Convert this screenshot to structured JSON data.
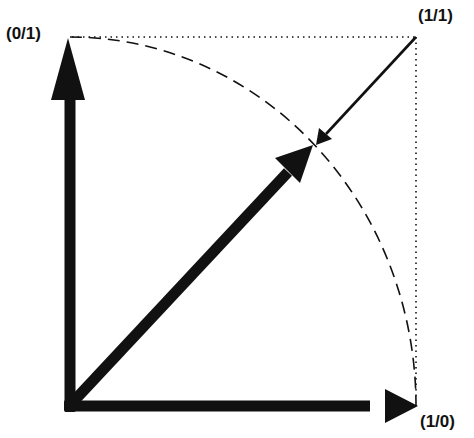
{
  "labels": {
    "top_left": "(0/1)",
    "top_right": "(1/1)",
    "bottom_right": "(1/0)"
  },
  "colors": {
    "ink": "#111111",
    "background": "#ffffff"
  }
}
